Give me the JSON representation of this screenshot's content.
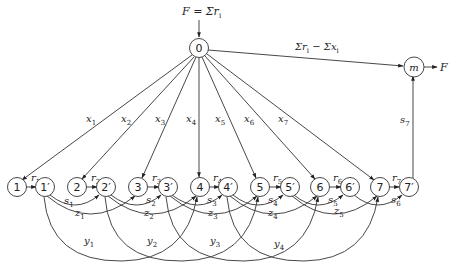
{
  "diagram": {
    "type": "network-flow",
    "top_label": "F = Σr",
    "top_label_sub": "i",
    "top_right_label": "Σr",
    "top_right_label_sub1": "i",
    "top_right_label_mid": " − Σx",
    "top_right_label_sub2": "i",
    "sink_output_label": "F",
    "nodes": {
      "source": "0",
      "sink": "m",
      "n1": "1",
      "n1p": "1′",
      "n2": "2",
      "n2p": "2′",
      "n3": "3",
      "n3p": "3′",
      "n4": "4",
      "n4p": "4′",
      "n5": "5",
      "n5p": "5′",
      "n6": "6",
      "n6p": "6′",
      "n7": "7",
      "n7p": "7′"
    },
    "x_labels": [
      {
        "base": "x",
        "sub": "1"
      },
      {
        "base": "x",
        "sub": "2"
      },
      {
        "base": "x",
        "sub": "3"
      },
      {
        "base": "x",
        "sub": "4"
      },
      {
        "base": "x",
        "sub": "5"
      },
      {
        "base": "x",
        "sub": "6"
      },
      {
        "base": "x",
        "sub": "7"
      }
    ],
    "r_labels": [
      {
        "base": "r",
        "sub": "1"
      },
      {
        "base": "r",
        "sub": "2"
      },
      {
        "base": "r",
        "sub": "3"
      },
      {
        "base": "r",
        "sub": "4"
      },
      {
        "base": "r",
        "sub": "5"
      },
      {
        "base": "r",
        "sub": "6"
      },
      {
        "base": "r",
        "sub": "7"
      }
    ],
    "s_labels": [
      {
        "base": "s",
        "sub": "1"
      },
      {
        "base": "s",
        "sub": "2"
      },
      {
        "base": "s",
        "sub": "3"
      },
      {
        "base": "s",
        "sub": "4"
      },
      {
        "base": "s",
        "sub": "5"
      },
      {
        "base": "s",
        "sub": "6"
      },
      {
        "base": "s",
        "sub": "7"
      }
    ],
    "z_labels": [
      {
        "base": "z",
        "sub": "1"
      },
      {
        "base": "z",
        "sub": "2"
      },
      {
        "base": "z",
        "sub": "3"
      },
      {
        "base": "z",
        "sub": "4"
      },
      {
        "base": "z",
        "sub": "5"
      }
    ],
    "y_labels": [
      {
        "base": "y",
        "sub": "1"
      },
      {
        "base": "y",
        "sub": "2"
      },
      {
        "base": "y",
        "sub": "3"
      },
      {
        "base": "y",
        "sub": "4"
      }
    ]
  }
}
